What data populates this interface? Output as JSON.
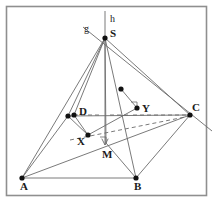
{
  "figure": {
    "frame": {
      "x": 6.5,
      "y": 6.5,
      "width": 200,
      "height": 189,
      "stroke": "#8f8f8f",
      "stroke_width": 1.6
    },
    "canvas": {
      "width": 222,
      "height": 208,
      "background": "#ffffff"
    },
    "colors": {
      "line": "#6b6b6b",
      "line_dark": "#555555",
      "vertex_dot": "#111111",
      "label_text": "#1a1a1a",
      "frame": "#8f8f8f"
    },
    "points": [
      {
        "id": "S",
        "label": "S",
        "x": 105.0,
        "y": 38.0,
        "dot": true,
        "label_dx": 5,
        "label_dy": -4,
        "kind": "apex"
      },
      {
        "id": "A",
        "label": "A",
        "x": 22.0,
        "y": 178.0,
        "dot": true,
        "label_dx": -2,
        "label_dy": 9,
        "kind": "base-vertex"
      },
      {
        "id": "B",
        "label": "B",
        "x": 136.0,
        "y": 178.0,
        "dot": true,
        "label_dx": -2,
        "label_dy": 9,
        "kind": "base-vertex"
      },
      {
        "id": "C",
        "label": "C",
        "x": 190.0,
        "y": 115.0,
        "dot": true,
        "label_dx": 2,
        "label_dy": -7,
        "kind": "base-vertex"
      },
      {
        "id": "D",
        "label": "D",
        "x": 74.0,
        "y": 115.0,
        "dot": true,
        "label_dx": 5,
        "label_dy": -3,
        "kind": "base-vertex"
      },
      {
        "id": "D2",
        "label": "",
        "x": 68.0,
        "y": 116.0,
        "dot": true,
        "label_dx": 0,
        "label_dy": 0,
        "kind": "aux-dot"
      },
      {
        "id": "X",
        "label": "X",
        "x": 88.0,
        "y": 135.0,
        "dot": true,
        "label_dx": -11,
        "label_dy": 7,
        "kind": "interior"
      },
      {
        "id": "Y",
        "label": "Y",
        "x": 137.0,
        "y": 108.0,
        "dot": true,
        "label_dx": 5,
        "label_dy": 1,
        "kind": "interior"
      },
      {
        "id": "P",
        "label": "",
        "x": 121.0,
        "y": 89.0,
        "dot": true,
        "label_dx": 0,
        "label_dy": 0,
        "kind": "on-edge-SB"
      },
      {
        "id": "M",
        "label": "M",
        "x": 106.0,
        "y": 143.0,
        "dot": false,
        "label_dx": -4,
        "label_dy": 12,
        "kind": "foot-of-altitude"
      }
    ],
    "line_labels": [
      {
        "id": "g",
        "label": "g",
        "x": 84.0,
        "y": 24.0
      },
      {
        "id": "h",
        "label": "h",
        "x": 110.0,
        "y": 14.0
      }
    ],
    "segments": [
      {
        "id": "SA",
        "from": "S",
        "to": "A",
        "style": "solid"
      },
      {
        "id": "SB",
        "from": "S",
        "to": "B",
        "style": "solid"
      },
      {
        "id": "SC",
        "from": "S",
        "to": "C",
        "style": "solid"
      },
      {
        "id": "SD",
        "from": "S",
        "to": "D",
        "style": "solid"
      },
      {
        "id": "SD2",
        "from": "S",
        "to": "D2",
        "style": "solid"
      },
      {
        "id": "SM",
        "from": "S",
        "to": "M",
        "style": "solid"
      },
      {
        "id": "AB",
        "from": "A",
        "to": "B",
        "style": "solid"
      },
      {
        "id": "BC",
        "from": "B",
        "to": "C",
        "style": "solid"
      },
      {
        "id": "AC",
        "from": "A",
        "to": "C",
        "style": "solid"
      },
      {
        "id": "AD2",
        "from": "A",
        "to": "D2",
        "style": "solid"
      },
      {
        "id": "D2C",
        "from": "D2",
        "to": "C",
        "style": "solid"
      },
      {
        "id": "D2X",
        "from": "D2",
        "to": "X",
        "style": "solid"
      },
      {
        "id": "DX",
        "from": "D",
        "to": "X",
        "style": "solid"
      },
      {
        "id": "XY",
        "from": "X",
        "to": "Y",
        "style": "solid"
      },
      {
        "id": "YP",
        "from": "Y",
        "to": "P",
        "style": "solid"
      },
      {
        "id": "MB",
        "from": "M",
        "to": "B",
        "style": "solid"
      }
    ],
    "dashed_runs": [
      {
        "id": "DC-hidden-left",
        "x1": 74.0,
        "y1": 115.0,
        "x2": 102.0,
        "y2": 115.0
      },
      {
        "id": "DC-hidden-mid",
        "x1": 110.0,
        "y1": 115.0,
        "x2": 128.0,
        "y2": 115.0
      },
      {
        "id": "DC-hidden-right",
        "x1": 133.0,
        "y1": 115.0,
        "x2": 190.0,
        "y2": 115.0
      },
      {
        "id": "hidden-to-C",
        "x1": 70.0,
        "y1": 140.0,
        "x2": 190.0,
        "y2": 116.0
      }
    ],
    "axis_h": {
      "id": "h-axis",
      "x1": 105.0,
      "y1": 11.0,
      "x2": 105.0,
      "y2": 145.0,
      "arrow_at": "end",
      "style": "solid"
    },
    "axis_g": {
      "id": "g-axis",
      "x1": 83.0,
      "y1": 27.0,
      "x2": 212.0,
      "y2": 131.0,
      "style": "solid"
    },
    "right_angle_marks": [
      {
        "id": "ra-at-M",
        "cx": 106.0,
        "cy": 143.0,
        "size": 6
      },
      {
        "id": "ra-at-Y",
        "cx": 137.0,
        "cy": 108.0,
        "size": 6
      }
    ]
  }
}
